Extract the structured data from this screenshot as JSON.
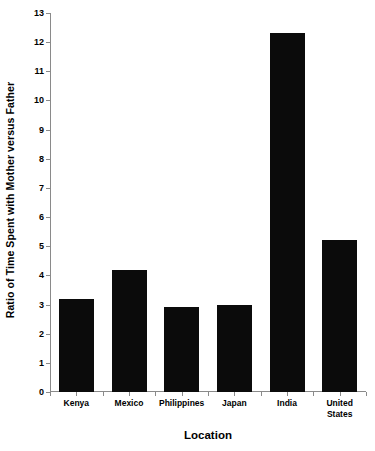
{
  "chart_data": {
    "type": "bar",
    "title": "",
    "subtitle": "",
    "xlabel": "Location",
    "ylabel": "Ratio of Time Spent with Mother versus Father",
    "categories": [
      "Kenya",
      "Mexico",
      "Philippines",
      "Japan",
      "India",
      "United States"
    ],
    "category_lines": [
      [
        "Kenya"
      ],
      [
        "Mexico"
      ],
      [
        "Philippines"
      ],
      [
        "Japan"
      ],
      [
        "India"
      ],
      [
        "United",
        "States"
      ]
    ],
    "values": [
      3.2,
      4.2,
      2.9,
      3.0,
      12.3,
      5.2
    ],
    "ylim": [
      0,
      13
    ],
    "ytick_step": 1,
    "yticks": [
      0,
      1,
      2,
      3,
      4,
      5,
      6,
      7,
      8,
      9,
      10,
      11,
      12,
      13
    ],
    "ytick_labels": [
      "0",
      "1",
      "2",
      "3",
      "4",
      "5",
      "6",
      "7",
      "8",
      "9",
      "10",
      "11",
      "12",
      "13"
    ],
    "grid": false,
    "legend": null,
    "legend_position": "none",
    "annotations": [],
    "bar_color": "#0b0b0b",
    "axis_color": "#8a8a8a",
    "background_color": "#ffffff"
  }
}
